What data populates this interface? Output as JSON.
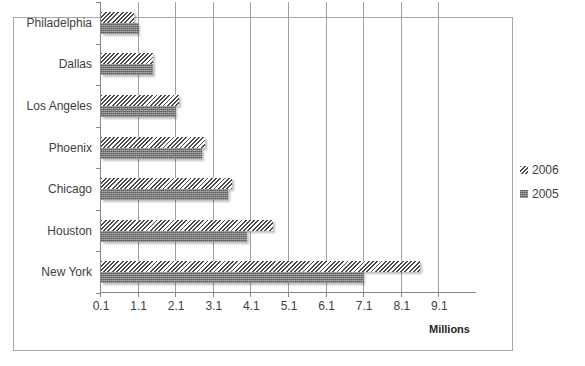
{
  "chart_data": {
    "type": "bar",
    "orientation": "horizontal",
    "title": "",
    "xlabel": "Millions",
    "ylabel": "",
    "categories": [
      "New York",
      "Houston",
      "Chicago",
      "Phoenix",
      "Los Angeles",
      "Dallas",
      "Philadelphia"
    ],
    "series": [
      {
        "name": "2006",
        "pattern": "diagonal-hatch",
        "values": [
          8.6,
          4.7,
          3.6,
          2.9,
          2.2,
          1.5,
          1.0
        ]
      },
      {
        "name": "2005",
        "pattern": "dense-crosshatch",
        "values": [
          7.1,
          4.0,
          3.5,
          2.8,
          2.1,
          1.5,
          1.1
        ]
      }
    ],
    "xlim": [
      0.1,
      10.1
    ],
    "x_ticks": [
      "0.1",
      "1.1",
      "2.1",
      "3.1",
      "4.1",
      "5.1",
      "6.1",
      "7.1",
      "8.1",
      "9.1"
    ],
    "grid": {
      "vertical": true,
      "horizontal": false
    },
    "legend": {
      "position": "right",
      "entries": [
        "2006",
        "2005"
      ]
    },
    "colors": {
      "bar_2006": "#4a4a4a",
      "bar_2005": "#7a7a7a",
      "grid": "#a0a0a0",
      "axis": "#868686",
      "frame": "#a6a6a6"
    }
  },
  "labels": {
    "xaxis_title": "Millions",
    "legend_2006": "2006",
    "legend_2005": "2005"
  }
}
